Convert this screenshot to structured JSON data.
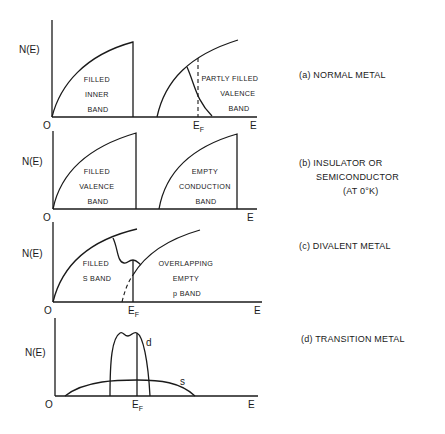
{
  "figure": {
    "axis_labels": {
      "y": "N(E)",
      "x": "E",
      "origin": "O",
      "fermi": "E",
      "fermi_sub": "F"
    },
    "panels": [
      {
        "id": "a",
        "caption": "(a) NORMAL METAL",
        "bands": [
          {
            "lines": [
              "FILLED",
              "INNER",
              "BAND"
            ]
          },
          {
            "lines": [
              "PARTLY FILLED",
              "VALENCE",
              "BAND"
            ]
          }
        ],
        "show_fermi": true
      },
      {
        "id": "b",
        "caption_lines": [
          "(b) INSULATOR OR",
          "SEMICONDUCTOR",
          "(AT 0°K)"
        ],
        "bands": [
          {
            "lines": [
              "FILLED",
              "VALENCE",
              "BAND"
            ]
          },
          {
            "lines": [
              "EMPTY",
              "CONDUCTION",
              "BAND"
            ]
          }
        ],
        "show_fermi": false
      },
      {
        "id": "c",
        "caption": "(c) DIVALENT METAL",
        "bands": [
          {
            "lines": [
              "FILLED",
              "S BAND"
            ]
          },
          {
            "lines": [
              "OVERLAPPING",
              "EMPTY",
              "p BAND"
            ]
          }
        ],
        "show_fermi": true
      },
      {
        "id": "d",
        "caption": "(d) TRANSITION METAL",
        "bands": [
          {
            "label": "d"
          },
          {
            "label": "s"
          }
        ],
        "show_fermi": true
      }
    ]
  }
}
